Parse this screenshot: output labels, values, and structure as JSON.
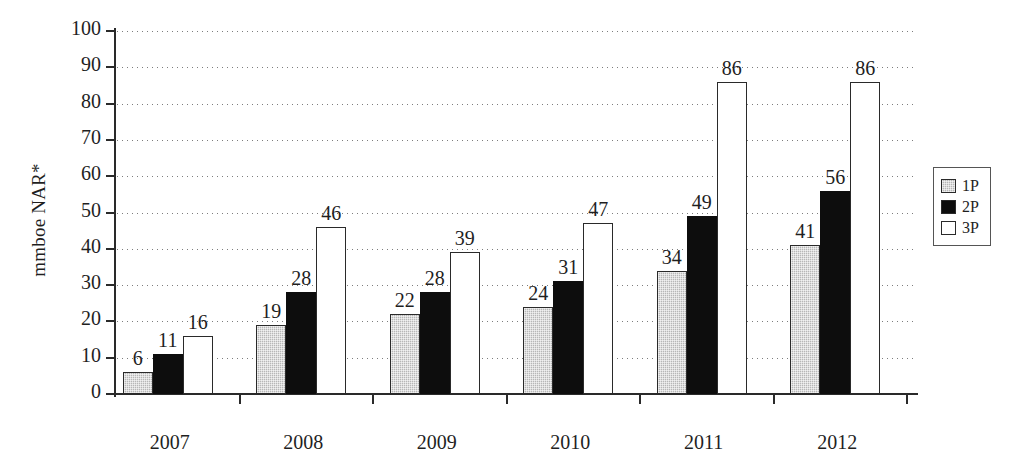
{
  "chart_data": {
    "type": "bar",
    "title": "",
    "xlabel": "",
    "ylabel": "mmboe NAR*",
    "ylim": [
      0,
      100
    ],
    "ytick_step": 10,
    "yticks": [
      0,
      10,
      20,
      30,
      40,
      50,
      60,
      70,
      80,
      90,
      100
    ],
    "grid": true,
    "grid_style": "dotted-horizontal",
    "legend_position": "right-outside",
    "categories": [
      "2007",
      "2008",
      "2009",
      "2010",
      "2011",
      "2012"
    ],
    "series": [
      {
        "name": "1P",
        "values": [
          6,
          19,
          22,
          24,
          34,
          41
        ],
        "color": "#b7b7b7",
        "pattern": "stipple"
      },
      {
        "name": "2P",
        "values": [
          11,
          28,
          28,
          31,
          49,
          56
        ],
        "color": "#0d0d0d",
        "pattern": "solid"
      },
      {
        "name": "3P",
        "values": [
          16,
          46,
          39,
          47,
          86,
          86
        ],
        "color": "#ffffff",
        "pattern": "outline"
      }
    ],
    "data_labels": true
  },
  "legend": {
    "items": [
      {
        "label": "1P",
        "swatch": "gray-stipple-swatch"
      },
      {
        "label": "2P",
        "swatch": "black-swatch"
      },
      {
        "label": "3P",
        "swatch": "white-swatch"
      }
    ]
  }
}
